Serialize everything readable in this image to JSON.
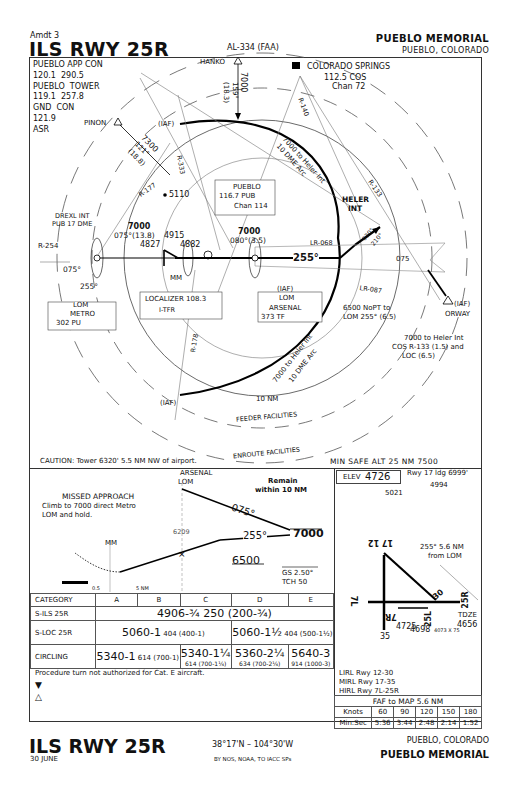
{
  "header": {
    "amendment": "Amdt 3",
    "procedure_title": "ILS RWY 25R",
    "chart_id": "AL-334 (FAA)",
    "airport_name": "PUEBLO MEMORIAL",
    "city_state": "PUEBLO, COLORADO"
  },
  "communications": {
    "lines": "PUEBLO APP CON\n120.1  290.5\nPUEBLO  TOWER\n119.1  257.8\nGND  CON\n121.9\nASR"
  },
  "plan_view": {
    "fixes": {
      "hanko": "HANKO",
      "pinon": "PINON",
      "iaf": "(IAF)",
      "colorado_springs": "COLORADO  SPRINGS",
      "cos_freq": "112.5 COS",
      "cos_chan": "Chan 72",
      "drexl_1": "DREXL INT",
      "drexl_2": "PUB 17 DME",
      "heler_1": "HELER",
      "heler_2": "INT",
      "orway_iaf": "(IAF)",
      "orway": "ORWAY",
      "mm": "MM"
    },
    "navaids": {
      "pueblo_vor_1": "PUEBLO",
      "pueblo_vor_2": "116.7  PUB",
      "pueblo_vor_3": "Chan 114",
      "localizer_1": "LOCALIZER  108.3",
      "localizer_2": "I-TFR",
      "lom_metro_1": "LOM",
      "lom_metro_2": "METRO",
      "lom_metro_3": "302  PU",
      "lom_arsenal_1": "(IAF)",
      "lom_arsenal_2": "LOM",
      "lom_arsenal_3": "ARSENAL",
      "lom_arsenal_4": "373  TF"
    },
    "routes": {
      "hanko_alt": "7000",
      "hanko_crs": "159°",
      "hanko_dist": "(18.3)",
      "pinon_alt": "7300",
      "pinon_crs": "121°",
      "pinon_dist": "(18.8)",
      "arc_north_1": "7000 to Heler Int",
      "arc_north_2": "10 DME Arc",
      "arc_south_1": "7000 to Heler Int",
      "arc_south_2": "10 DME Arc",
      "drexl_alt": "7000",
      "drexl_crs": "075°(13.8)",
      "vor_alt": "7000",
      "vor_crs": "080°(3.5)",
      "final_crs": "255°",
      "hold_in": "075°",
      "hold_out": "255°",
      "pt_out": "075",
      "pt_030": "030°",
      "pt_210": "210°",
      "pt_note_1": "6500 NoPT to",
      "pt_note_2": "LOM  255° (6.5)",
      "orway_note_1": "7000 to Heler Int",
      "orway_note_2": "COS  R-133 (1.5) and",
      "orway_note_3": "LOC (6.5)"
    },
    "radials": {
      "r254": "R-254",
      "r177": "R-177",
      "r333": "R-333",
      "r140": "R-140",
      "r133": "R-133",
      "lr068": "LR-068",
      "lr087": "LR-087",
      "r178": "R-178"
    },
    "obstacles": {
      "o5110": "5110",
      "o4915": "4915",
      "o4827": "4827",
      "o4882": "4882"
    },
    "rings": {
      "ten_nm": "10 NM",
      "feeder": "FEEDER FACILITIES",
      "enroute": "ENROUTE FACILITIES"
    },
    "caution": "CAUTION: Tower 6320' 5.5 NM NW of airport.",
    "msa": "MIN SAFE ALT 25 NM 7500"
  },
  "profile": {
    "missed_title": "MISSED  APPROACH",
    "missed_1": "Climb to 7000 direct Metro",
    "missed_2": "LOM and hold.",
    "arsenal_1": "ARSENAL",
    "arsenal_2": "LOM",
    "remain_1": "Remain",
    "remain_2": "within 10 NM",
    "out_crs": "075°",
    "in_crs": "255°",
    "alt_7000": "7000",
    "alt_6500": "6500",
    "gs_alt": "6209",
    "mm": "MM",
    "gs": "GS 2.50°",
    "tch": "TCH 50",
    "dist_1": "0.5",
    "dist_2": "5  NM"
  },
  "airport": {
    "elev_label": "ELEV",
    "elev": "4726",
    "rwy17_ldg": "Rwy 17 ldg 6999'",
    "obst_5021": "5021",
    "obst_4994": "4994",
    "fap_note_1": "255° 5.6 NM",
    "fap_note_2": "from LOM",
    "rwy_1712": "17 12",
    "rwy_30": "30",
    "rwy_7l": "7L",
    "rwy_25r": "25R",
    "rwy_25l": "25L",
    "rwy_7r": "7R",
    "rwy_35": "35",
    "tdze_label": "TDZE",
    "tdze": "4656",
    "elev_4725": "4725",
    "elev_4698": "4698",
    "dim_25l": "4073 X 75",
    "lights_1": "LIRL Rwy 12-30",
    "lights_2": "MIRL Rwy 17-35",
    "lights_3": "HIRL Rwy 7L-25R"
  },
  "minimums": {
    "headers": [
      "CATEGORY",
      "A",
      "B",
      "C",
      "D",
      "E"
    ],
    "s_ils": {
      "label": "S-ILS 25R",
      "value": "4906-¾  250 (200-¾)"
    },
    "s_loc": {
      "label": "S-LOC 25R",
      "ab": "5060-1",
      "ab_small": "404 (400-1)",
      "de": "5060-1½",
      "de_small": "404 (500-1½)"
    },
    "circling": {
      "label": "CIRCLING",
      "ab": "5340-1",
      "ab_small": "614 (700-1)",
      "c": "5340-1¼",
      "c_small": "614 (700-1¼)",
      "d": "5360-2¼",
      "d_small": "634 (700-2¼)",
      "e": "5640-3",
      "e_small": "914 (1000-3)"
    },
    "note": "Procedure turn not authorized for Cat. E aircraft."
  },
  "timing": {
    "title": "FAF to MAP 5.6 NM",
    "knots_label": "Knots",
    "knots": [
      "60",
      "90",
      "120",
      "150",
      "180"
    ],
    "time_label": "Min:Sec",
    "times": [
      "5:36",
      "3:44",
      "2:48",
      "2:14",
      "1:52"
    ]
  },
  "footer": {
    "procedure_title": "ILS RWY 25R",
    "date": "30 JUNE",
    "coordinates": "38°17'N – 104°30'W",
    "publisher": "BY NOS, NOAA, TO IACC SPs",
    "city_state": "PUEBLO, COLORADO",
    "airport_name": "PUEBLO MEMORIAL"
  }
}
